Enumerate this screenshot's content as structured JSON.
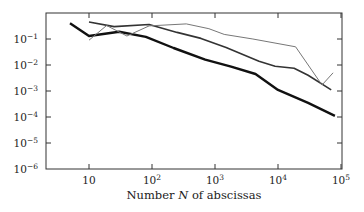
{
  "chart_data": {
    "type": "line",
    "title": "",
    "xlabel": "Number N of abscissas",
    "ylabel": "",
    "xscale": "log",
    "yscale": "log",
    "xlim": [
      2,
      100000
    ],
    "ylim": [
      1e-06,
      1
    ],
    "grid": false,
    "legend": null,
    "x_ticks": [
      {
        "value": 10,
        "base": "10",
        "exp": ""
      },
      {
        "value": 100,
        "base": "10",
        "exp": "2"
      },
      {
        "value": 1000,
        "base": "10",
        "exp": "3"
      },
      {
        "value": 10000,
        "base": "10",
        "exp": "4"
      },
      {
        "value": 100000,
        "base": "10",
        "exp": "5"
      }
    ],
    "y_ticks": [
      {
        "value": 0.1,
        "base": "10",
        "exp": "−1"
      },
      {
        "value": 0.01,
        "base": "10",
        "exp": "−2"
      },
      {
        "value": 0.001,
        "base": "10",
        "exp": "−3"
      },
      {
        "value": 0.0001,
        "base": "10",
        "exp": "−4"
      },
      {
        "value": 1e-05,
        "base": "10",
        "exp": "−5"
      },
      {
        "value": 1e-06,
        "base": "10",
        "exp": "−6"
      }
    ],
    "series": [
      {
        "name": "thick",
        "color": "#111111",
        "width": 2.4,
        "points": [
          [
            5,
            0.4
          ],
          [
            10,
            0.13
          ],
          [
            30,
            0.19
          ],
          [
            80,
            0.12
          ],
          [
            220,
            0.045
          ],
          [
            700,
            0.016
          ],
          [
            1800,
            0.0087
          ],
          [
            4400,
            0.0045
          ],
          [
            10000,
            0.0011
          ],
          [
            30000,
            0.00035
          ],
          [
            80000,
            0.00011
          ]
        ]
      },
      {
        "name": "medium",
        "color": "#333333",
        "width": 1.6,
        "points": [
          [
            10,
            0.45
          ],
          [
            25,
            0.3
          ],
          [
            90,
            0.36
          ],
          [
            250,
            0.18
          ],
          [
            600,
            0.105
          ],
          [
            1500,
            0.047
          ],
          [
            5000,
            0.014
          ],
          [
            9000,
            0.009
          ],
          [
            18000,
            0.0075
          ],
          [
            30000,
            0.004
          ],
          [
            70000,
            0.0011
          ]
        ]
      },
      {
        "name": "thin",
        "color": "#777777",
        "width": 1.0,
        "points": [
          [
            10,
            0.09
          ],
          [
            19,
            0.33
          ],
          [
            40,
            0.13
          ],
          [
            90,
            0.32
          ],
          [
            350,
            0.38
          ],
          [
            800,
            0.25
          ],
          [
            1400,
            0.15
          ],
          [
            4000,
            0.1
          ],
          [
            19000,
            0.05
          ],
          [
            50000,
            0.0017
          ],
          [
            75000,
            0.005
          ]
        ]
      }
    ]
  }
}
